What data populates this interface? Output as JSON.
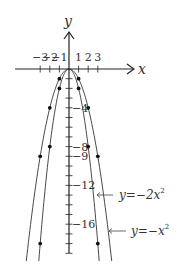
{
  "chart_data": {
    "type": "line",
    "title": "",
    "xlabel": "x",
    "ylabel": "y",
    "x_ticks": [
      -3,
      -2,
      -1,
      1,
      2,
      3
    ],
    "x_tick_labels": [
      "−3",
      "−2",
      "−1",
      "1",
      "2",
      "3"
    ],
    "y_tick_labels": [
      {
        "value": -4,
        "label": "−4"
      },
      {
        "value": -8,
        "label": "−8"
      },
      {
        "value": -9,
        "label": "−9"
      },
      {
        "value": -12,
        "label": "−12"
      },
      {
        "value": -16,
        "label": "−16"
      }
    ],
    "xlim": [
      -5.6,
      7.6
    ],
    "ylim": [
      -19.2,
      3.8
    ],
    "grid": false,
    "legend": "inline annotations with arrows",
    "series": [
      {
        "name": "y=−x²",
        "coef": -1,
        "label": "y=−x²",
        "points": [
          {
            "x": -3,
            "y": -9
          },
          {
            "x": -2,
            "y": -4
          },
          {
            "x": -1,
            "y": -1
          },
          {
            "x": 0,
            "y": 0
          },
          {
            "x": 1,
            "y": -1
          },
          {
            "x": 2,
            "y": -4
          },
          {
            "x": 3,
            "y": -9
          }
        ]
      },
      {
        "name": "y=−2x²",
        "coef": -2,
        "label": "y=−2x²",
        "points": [
          {
            "x": -3,
            "y": -18
          },
          {
            "x": -2,
            "y": -8
          },
          {
            "x": -1,
            "y": -2
          },
          {
            "x": 0,
            "y": 0
          },
          {
            "x": 1,
            "y": -2
          },
          {
            "x": 2,
            "y": -8
          },
          {
            "x": 3,
            "y": -18
          }
        ]
      }
    ]
  },
  "labels": {
    "x_axis": "x",
    "y_axis": "y",
    "curve1_prefix": "y=−2x",
    "curve1_exp": "2",
    "curve2_prefix": "y=−x",
    "curve2_exp": "2"
  },
  "colors": {
    "axis": "#222222",
    "curve": "#333333",
    "point": "#111111",
    "text": "#333333"
  }
}
